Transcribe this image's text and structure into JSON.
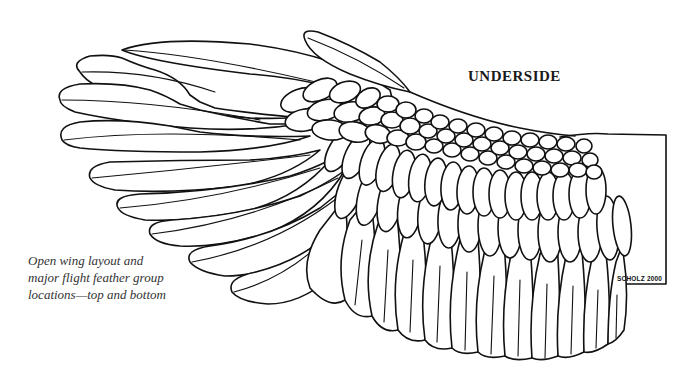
{
  "illustration": {
    "subject": "bird wing underside line drawing",
    "heading": "UNDERSIDE",
    "caption_lines": [
      "Open wing layout and",
      "major flight feather group",
      "locations—top and bottom"
    ],
    "signature": "SCHOLZ 2000",
    "colors": {
      "background": "#ffffff",
      "line": "#111111",
      "caption_text": "#333333"
    }
  }
}
